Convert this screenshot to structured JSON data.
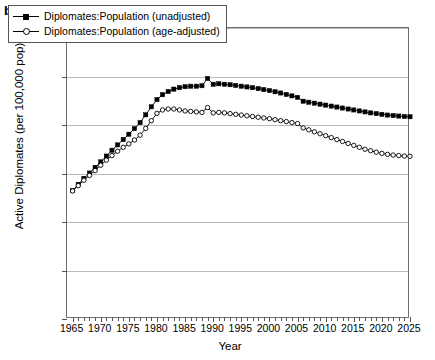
{
  "panel": {
    "label": "b"
  },
  "chart_data": {
    "type": "line",
    "title": "",
    "xlabel": "Year",
    "ylabel": "Active Diplomates (per 100,000 pop)",
    "xlim": [
      1964,
      2025
    ],
    "ylim": [
      0.0,
      12.0
    ],
    "yticks": [
      "0.0",
      "2.0",
      "4.0",
      "6.0",
      "8.0",
      "10.0",
      "12.0"
    ],
    "ytick_values": [
      0,
      2,
      4,
      6,
      8,
      10,
      12
    ],
    "xticks": [
      "1965",
      "1970",
      "1975",
      "1980",
      "1985",
      "1990",
      "1995",
      "2000",
      "2005",
      "2010",
      "2015",
      "2020",
      "2025"
    ],
    "xtick_values": [
      1965,
      1970,
      1975,
      1980,
      1985,
      1990,
      1995,
      2000,
      2005,
      2010,
      2015,
      2020,
      2025
    ],
    "grid": true,
    "legend_position": "top-left",
    "x": [
      1965,
      1966,
      1967,
      1968,
      1969,
      1970,
      1971,
      1972,
      1973,
      1974,
      1975,
      1976,
      1977,
      1978,
      1979,
      1980,
      1981,
      1982,
      1983,
      1984,
      1985,
      1986,
      1987,
      1988,
      1989,
      1990,
      1991,
      1992,
      1993,
      1994,
      1995,
      1996,
      1997,
      1998,
      1999,
      2000,
      2001,
      2002,
      2003,
      2004,
      2005,
      2006,
      2007,
      2008,
      2009,
      2010,
      2011,
      2012,
      2013,
      2014,
      2015,
      2016,
      2017,
      2018,
      2019,
      2020,
      2021,
      2022,
      2023,
      2024,
      2025
    ],
    "series": [
      {
        "name": "Diplomates:Population (unadjusted)",
        "marker": "filled-square",
        "color": "#000000",
        "values": [
          5.3,
          5.55,
          5.8,
          6.02,
          6.25,
          6.48,
          6.72,
          6.96,
          7.18,
          7.4,
          7.62,
          7.85,
          8.1,
          8.42,
          8.75,
          9.05,
          9.25,
          9.38,
          9.48,
          9.54,
          9.58,
          9.6,
          9.6,
          9.62,
          9.92,
          9.68,
          9.7,
          9.68,
          9.66,
          9.63,
          9.6,
          9.57,
          9.54,
          9.5,
          9.46,
          9.42,
          9.37,
          9.32,
          9.26,
          9.2,
          9.14,
          8.98,
          8.94,
          8.9,
          8.86,
          8.82,
          8.78,
          8.74,
          8.7,
          8.66,
          8.62,
          8.58,
          8.54,
          8.5,
          8.47,
          8.44,
          8.41,
          8.39,
          8.37,
          8.35,
          8.34
        ]
      },
      {
        "name": "Diplomates:Population (age-adjusted)",
        "marker": "open-circle",
        "color": "#000000",
        "values": [
          5.28,
          5.5,
          5.72,
          5.92,
          6.12,
          6.34,
          6.55,
          6.74,
          6.92,
          7.08,
          7.22,
          7.38,
          7.58,
          7.86,
          8.18,
          8.48,
          8.62,
          8.66,
          8.66,
          8.62,
          8.58,
          8.56,
          8.54,
          8.52,
          8.72,
          8.5,
          8.52,
          8.5,
          8.47,
          8.44,
          8.41,
          8.38,
          8.35,
          8.32,
          8.29,
          8.26,
          8.22,
          8.18,
          8.14,
          8.1,
          8.06,
          7.88,
          7.8,
          7.72,
          7.64,
          7.56,
          7.48,
          7.4,
          7.32,
          7.24,
          7.16,
          7.08,
          7.0,
          6.94,
          6.88,
          6.83,
          6.79,
          6.76,
          6.74,
          6.72,
          6.71
        ]
      }
    ]
  }
}
